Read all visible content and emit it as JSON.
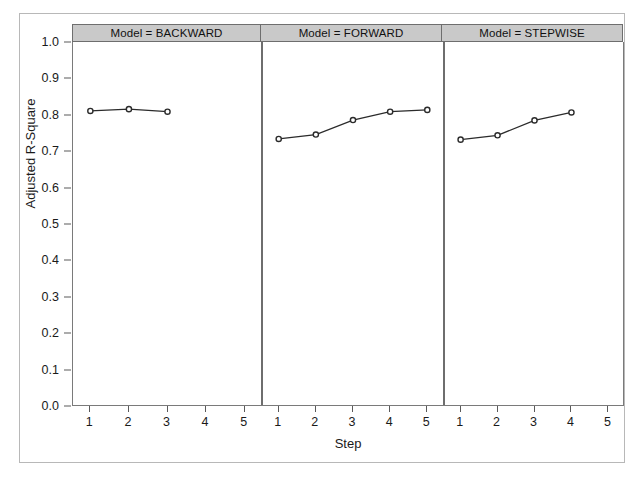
{
  "chart_data": {
    "type": "line",
    "title": "",
    "subtitle": "",
    "xlabel": "Step",
    "ylabel": "Adjusted R-Square",
    "xlim": [
      0.55,
      5.45
    ],
    "ylim": [
      0.0,
      1.0
    ],
    "xticks": [
      1,
      2,
      3,
      4,
      5
    ],
    "xtick_labels": [
      "1",
      "2",
      "3",
      "4",
      "5"
    ],
    "yticks": [
      0.0,
      0.1,
      0.2,
      0.3,
      0.4,
      0.5,
      0.6,
      0.7,
      0.8,
      0.9,
      1.0
    ],
    "ytick_labels": [
      "0.0",
      "0.1",
      "0.2",
      "0.3",
      "0.4",
      "0.5",
      "0.6",
      "0.7",
      "0.8",
      "0.9",
      "1.0"
    ],
    "grid": false,
    "legend": "none",
    "panel_variable": "Model",
    "marker": "open-circle",
    "line_color": "#2b2b2b",
    "marker_fill": "#ffffff",
    "header_background": "#c9c9c9",
    "panels": [
      {
        "label": "Model = BACKWARD",
        "model": "BACKWARD",
        "x": [
          1,
          2,
          3
        ],
        "values": [
          0.81,
          0.815,
          0.808
        ]
      },
      {
        "label": "Model = FORWARD",
        "model": "FORWARD",
        "x": [
          1,
          2,
          3,
          4,
          5
        ],
        "values": [
          0.733,
          0.745,
          0.785,
          0.808,
          0.813
        ]
      },
      {
        "label": "Model = STEPWISE",
        "model": "STEPWISE",
        "x": [
          1,
          2,
          3,
          4
        ],
        "values": [
          0.731,
          0.743,
          0.784,
          0.806
        ]
      }
    ]
  }
}
